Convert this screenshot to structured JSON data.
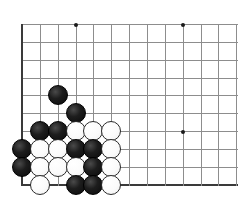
{
  "figure": {
    "kind": "go-board-diagram",
    "board_size": 19,
    "visible_region": "bottom-left corner",
    "width_px": 238,
    "height_px": 207
  },
  "board": {
    "origin_x": 22,
    "origin_y": 24,
    "spacing": 17.85,
    "columns": 13,
    "rows": 10,
    "left_edge_is_border": true,
    "bottom_edge_is_border": true,
    "line_color": "#8d8d8d",
    "edge_color": "#3a3a3a",
    "background_color": "#ffffff"
  },
  "star_points": [
    {
      "col": 3,
      "row": 0
    },
    {
      "col": 9,
      "row": 0
    },
    {
      "col": 9,
      "row": 6
    }
  ],
  "stones": [
    {
      "col": 2,
      "row": 4,
      "color": "black"
    },
    {
      "col": 3,
      "row": 5,
      "color": "black"
    },
    {
      "col": 1,
      "row": 6,
      "color": "black"
    },
    {
      "col": 2,
      "row": 6,
      "color": "black"
    },
    {
      "col": 3,
      "row": 6,
      "color": "white"
    },
    {
      "col": 4,
      "row": 6,
      "color": "white"
    },
    {
      "col": 5,
      "row": 6,
      "color": "white"
    },
    {
      "col": 0,
      "row": 7,
      "color": "black"
    },
    {
      "col": 1,
      "row": 7,
      "color": "white"
    },
    {
      "col": 2,
      "row": 7,
      "color": "white"
    },
    {
      "col": 3,
      "row": 7,
      "color": "black"
    },
    {
      "col": 4,
      "row": 7,
      "color": "black"
    },
    {
      "col": 5,
      "row": 7,
      "color": "white"
    },
    {
      "col": 0,
      "row": 8,
      "color": "black"
    },
    {
      "col": 1,
      "row": 8,
      "color": "white"
    },
    {
      "col": 2,
      "row": 8,
      "color": "white"
    },
    {
      "col": 3,
      "row": 8,
      "color": "white"
    },
    {
      "col": 4,
      "row": 8,
      "color": "black"
    },
    {
      "col": 5,
      "row": 8,
      "color": "white"
    },
    {
      "col": 1,
      "row": 9,
      "color": "white"
    },
    {
      "col": 3,
      "row": 9,
      "color": "black"
    },
    {
      "col": 4,
      "row": 9,
      "color": "black"
    },
    {
      "col": 5,
      "row": 9,
      "color": "white"
    }
  ],
  "counts": {
    "black_stones": 11,
    "white_stones": 11,
    "total_stones": 22
  },
  "chart_data": {
    "type": "heatmap",
    "xlabel": "",
    "ylabel": "",
    "categories": [
      "c0",
      "c1",
      "c2",
      "c3",
      "c4",
      "c5",
      "c6",
      "c7",
      "c8",
      "c9",
      "c10",
      "c11",
      "c12"
    ],
    "rows": [
      "r0",
      "r1",
      "r2",
      "r3",
      "r4",
      "r5",
      "r6",
      "r7",
      "r8",
      "r9"
    ],
    "legend": [
      "black stone",
      "white stone",
      "empty intersection",
      "star point"
    ],
    "grid": [
      [
        ".",
        ".",
        ".",
        "*",
        ".",
        ".",
        ".",
        ".",
        ".",
        "*",
        ".",
        ".",
        "."
      ],
      [
        ".",
        ".",
        ".",
        ".",
        ".",
        ".",
        ".",
        ".",
        ".",
        ".",
        ".",
        ".",
        "."
      ],
      [
        ".",
        ".",
        ".",
        ".",
        ".",
        ".",
        ".",
        ".",
        ".",
        ".",
        ".",
        ".",
        "."
      ],
      [
        ".",
        ".",
        ".",
        ".",
        ".",
        ".",
        ".",
        ".",
        ".",
        ".",
        ".",
        ".",
        "."
      ],
      [
        ".",
        ".",
        "B",
        ".",
        ".",
        ".",
        ".",
        ".",
        ".",
        ".",
        ".",
        ".",
        "."
      ],
      [
        ".",
        ".",
        ".",
        "B",
        ".",
        ".",
        ".",
        ".",
        ".",
        ".",
        ".",
        ".",
        "."
      ],
      [
        ".",
        "B",
        "B",
        "W",
        "W",
        "W",
        ".",
        ".",
        ".",
        "*",
        ".",
        ".",
        "."
      ],
      [
        "B",
        "W",
        "W",
        "B",
        "B",
        "W",
        ".",
        ".",
        ".",
        ".",
        ".",
        ".",
        "."
      ],
      [
        "B",
        "W",
        "W",
        "W",
        "B",
        "W",
        ".",
        ".",
        ".",
        ".",
        ".",
        ".",
        "."
      ],
      [
        ".",
        "W",
        ".",
        "B",
        "B",
        "W",
        ".",
        ".",
        ".",
        ".",
        ".",
        ".",
        "."
      ]
    ]
  }
}
